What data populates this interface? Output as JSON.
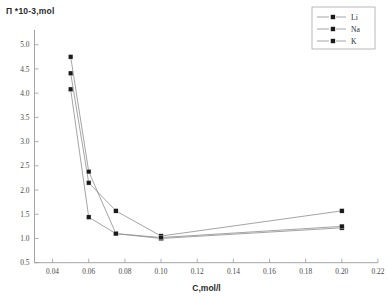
{
  "chart_data": {
    "type": "line",
    "title": "",
    "xlabel": "C,mol/l",
    "ylabel": "П *10-3,mol",
    "x": [
      0.05,
      0.06,
      0.075,
      0.1,
      0.2
    ],
    "series": [
      {
        "name": "Li",
        "values": [
          4.08,
          1.44,
          1.1,
          1.0,
          1.22
        ]
      },
      {
        "name": "Na",
        "values": [
          4.41,
          2.15,
          1.57,
          1.05,
          1.57
        ]
      },
      {
        "name": "K",
        "values": [
          4.75,
          2.38,
          1.1,
          1.02,
          1.25
        ]
      }
    ],
    "xlim": [
      0.03,
      0.22
    ],
    "ylim": [
      0.5,
      5.0
    ],
    "xticks": [
      "0.04",
      "0.06",
      "0.08",
      "0.10",
      "0.12",
      "0.14",
      "0.16",
      "0.18",
      "0.20",
      "0.22"
    ],
    "xtick_values": [
      0.04,
      0.06,
      0.08,
      0.1,
      0.12,
      0.14,
      0.16,
      0.18,
      0.2,
      0.22
    ],
    "yticks": [
      "0.5",
      "1.0",
      "1.5",
      "2.0",
      "2.5",
      "3.0",
      "3.5",
      "4.0",
      "4.5",
      "5.0"
    ],
    "ytick_values": [
      0.5,
      1.0,
      1.5,
      2.0,
      2.5,
      3.0,
      3.5,
      4.0,
      4.5,
      5.0
    ],
    "grid": false,
    "legend_position": "top-right",
    "legend": [
      "Li",
      "Na",
      "K"
    ],
    "marker": "filled-square",
    "line_color": "#8d8d8d",
    "marker_color": "#1a1a1a"
  }
}
